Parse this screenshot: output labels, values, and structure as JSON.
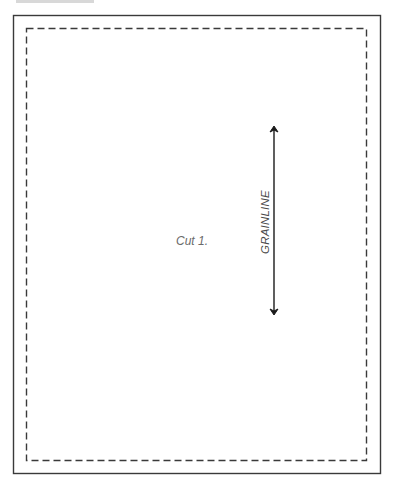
{
  "pattern_piece": {
    "header_clipped": "",
    "cut_instruction": "Cut 1.",
    "grainline_label": "GRAINLINE",
    "outline": {
      "cut_line": {
        "x": 13,
        "y": 15,
        "width": 368,
        "height": 459,
        "style": "solid",
        "color": "#3a3a3a"
      },
      "seam_line": {
        "x": 26,
        "y": 28,
        "width": 341,
        "height": 433,
        "style": "dashed",
        "color": "#3a3a3a"
      }
    },
    "grainline_arrow": {
      "x": 274,
      "y1": 127,
      "y2": 314,
      "color": "#1a1a1a",
      "double_headed": true
    }
  }
}
